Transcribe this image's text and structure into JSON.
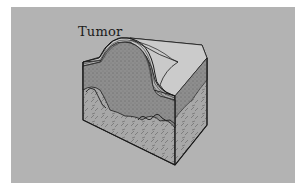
{
  "figure": {
    "labels": [
      {
        "text": "Tumor",
        "target": "tumor-dome"
      }
    ],
    "layers": [
      "epidermis",
      "tumor",
      "dermis"
    ],
    "colors": {
      "background": "#ffffff",
      "panel": "#b3b3b3",
      "top_surface": "#c9c9c9",
      "tumor_fill": "#8e8e8e",
      "dermis_fill": "#a9a9a9",
      "outline": "#1a1a1a"
    }
  }
}
